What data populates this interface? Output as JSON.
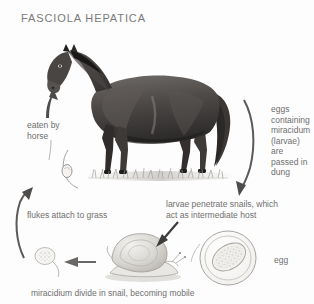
{
  "figure": {
    "title": "FASCIOLA HEPATICA",
    "kind": "life-cycle-diagram"
  },
  "labels": {
    "eaten_by_horse": "eaten by\nhorse",
    "eggs_passed": "eggs\ncontaining\nmiracidum\n(larvae) are\npassed in\ndung",
    "larvae_penetrate": "larvae penetrate snails, which\nact as intermediate host",
    "flukes_attach": "flukes attach to grass",
    "egg": "egg",
    "miracidium_divide": "miracidium divide in snail, becoming mobile"
  },
  "illustrations": {
    "horse": "horse-illustration",
    "grass": "grass-illustration",
    "fluke": "fluke-on-grass-illustration",
    "snail": "snail-illustration",
    "miracidium": "miracidium-illustration",
    "egg": "egg-illustration"
  },
  "arrows": {
    "up_to_horse": "arrow-up-eaten-by-horse",
    "down_right_dung": "arrow-curved-down-dung",
    "down_left_into_snail": "arrow-down-left-into-snail",
    "left_from_snail": "arrow-left-from-snail",
    "up_left_to_grass": "arrow-curved-up-to-grass"
  },
  "colors": {
    "background": "#fdfdfd",
    "text": "#6f6f6f",
    "title": "#7a7a7a",
    "arrow": "#5a5a5a",
    "line_art": "#9a9a9a"
  }
}
